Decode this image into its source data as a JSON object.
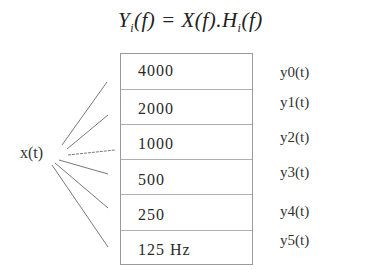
{
  "equation": {
    "lhs_symbol": "Y",
    "lhs_sub": "i",
    "lhs_arg": "(f) = ",
    "rhs_x": "X(f).",
    "rhs_h": "H",
    "rhs_sub": "i",
    "rhs_arg": "(f)"
  },
  "input_label": "x(t)",
  "filter_bank": {
    "bands": [
      {
        "label": "4000"
      },
      {
        "label": "2000"
      },
      {
        "label": "1000"
      },
      {
        "label": "500"
      },
      {
        "label": "250"
      },
      {
        "label": "125 Hz"
      }
    ]
  },
  "outputs": [
    {
      "label": "y0(t)"
    },
    {
      "label": "y1(t)"
    },
    {
      "label": "y2(t)"
    },
    {
      "label": "y3(t)"
    },
    {
      "label": "y4(t)"
    },
    {
      "label": "y5(t)"
    }
  ],
  "colors": {
    "line": "#7a7a7a",
    "border": "#9a9a9a",
    "text": "#2a2a2a"
  }
}
